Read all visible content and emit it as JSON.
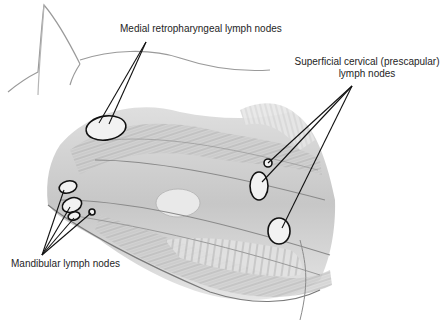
{
  "diagram": {
    "labels": {
      "medial_retropharyngeal": "Medial retropharyngeal lymph nodes",
      "superficial_cervical_line1": "Superficial cervical (prescapular)",
      "superficial_cervical_line2": "lymph nodes",
      "mandibular": "Mandibular lymph nodes"
    },
    "nodes": [
      {
        "name": "medial-retropharyngeal",
        "cx": 106,
        "cy": 128,
        "rx": 20,
        "ry": 12
      },
      {
        "name": "superficial-cervical-small",
        "cx": 268,
        "cy": 163,
        "rx": 4,
        "ry": 4
      },
      {
        "name": "superficial-cervical-upper",
        "cx": 259,
        "cy": 186,
        "rx": 9,
        "ry": 14
      },
      {
        "name": "superficial-cervical-lower",
        "cx": 279,
        "cy": 231,
        "rx": 11,
        "ry": 13
      },
      {
        "name": "mandibular-1",
        "cx": 68,
        "cy": 187,
        "rx": 9,
        "ry": 6
      },
      {
        "name": "mandibular-2",
        "cx": 72,
        "cy": 205,
        "rx": 10,
        "ry": 7
      },
      {
        "name": "mandibular-3",
        "cx": 74,
        "cy": 216,
        "rx": 6,
        "ry": 4
      },
      {
        "name": "mandibular-4",
        "cx": 92,
        "cy": 212,
        "rx": 3,
        "ry": 3
      }
    ],
    "colors": {
      "ink": "#1e1e1e",
      "pencil": "#8c8c8c",
      "shade": "#c8c8c8",
      "background": "#ffffff"
    }
  }
}
